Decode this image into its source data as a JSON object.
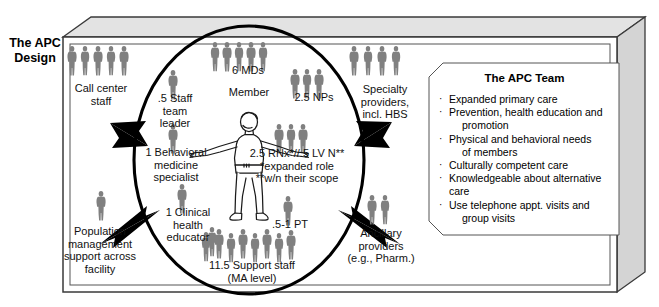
{
  "diagram": {
    "title": "The\nAPC\nDesign",
    "colors": {
      "figure_gray": "#808080",
      "box_face": "#d9d9d9",
      "box_top": "#e2e2e2",
      "outline": "#000000"
    },
    "outer_box_name": "three-dimensional-enclosure",
    "center_ellipse_name": "apc-team-ellipse"
  },
  "center": {
    "member_label": "Member"
  },
  "inside_roles": [
    {
      "id": "mds",
      "label": "6 MDs",
      "figures": 5
    },
    {
      "id": "nps",
      "label": "2.5 NPs",
      "figures": 3
    },
    {
      "id": "staff_lead",
      "label": ".5 Staff\nteam\nleader",
      "figures": 1
    },
    {
      "id": "behavioral",
      "label": "1 Behavioral\nmedicine\nspecialist",
      "figures": 1
    },
    {
      "id": "clinical_ed",
      "label": "1 Clinical\nhealth\neducator",
      "figures": 1
    },
    {
      "id": "rn_lvn",
      "label": "2.5 RNx*//.5 LV N**\n*expanded role\n**w/n their scope",
      "figures": 3
    },
    {
      "id": "pt",
      "label": ".5-1 PT",
      "figures": 1
    },
    {
      "id": "support_staff",
      "label": "11.5 Support staff\n(MA level)",
      "figures": 9
    }
  ],
  "outside_roles": [
    {
      "id": "call_center",
      "label": "Call center\nstaff",
      "figures": 5
    },
    {
      "id": "specialty",
      "label": "Specialty\nproviders,\nincl. HBS",
      "figures": 4
    },
    {
      "id": "population",
      "label": "Population\nmanagement\nsupport across\nfacility",
      "figures": 1
    },
    {
      "id": "ancillary",
      "label": "Ancillary\nproviders\n(e.g., Pharm.)",
      "figures": 2
    }
  ],
  "apc_team_panel": {
    "title": "The APC Team",
    "bullet_glyph": "·",
    "items": [
      {
        "line1": "Expanded primary care",
        "line2": ""
      },
      {
        "line1": "Prevention, health education and",
        "line2": "promotion"
      },
      {
        "line1": "Physical and behavioral needs",
        "line2": "of members"
      },
      {
        "line1": "Culturally competent care",
        "line2": ""
      },
      {
        "line1": "Knowledgeable about alternative care",
        "line2": ""
      },
      {
        "line1": "Use telephone appt. visits and",
        "line2": "group visits"
      }
    ]
  },
  "arrows": [
    {
      "id": "arrow-call-center",
      "name": "arrow-call-center-staff"
    },
    {
      "id": "arrow-specialty",
      "name": "arrow-specialty-providers"
    },
    {
      "id": "arrow-population",
      "name": "arrow-population-management"
    },
    {
      "id": "arrow-ancillary",
      "name": "arrow-ancillary-providers"
    }
  ]
}
